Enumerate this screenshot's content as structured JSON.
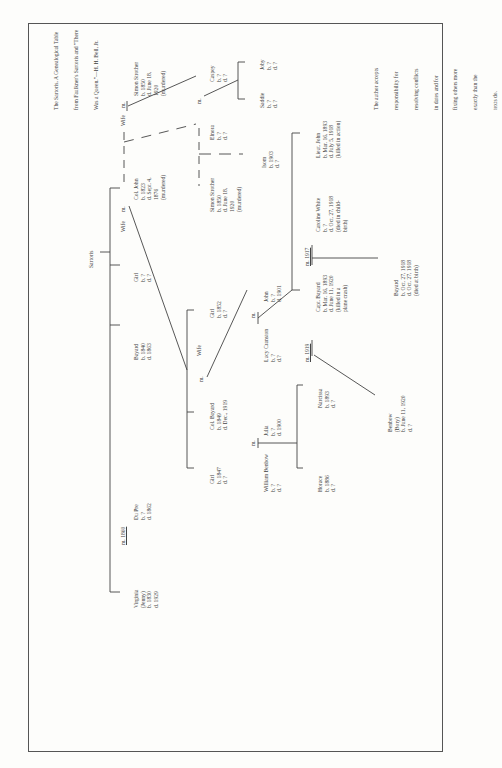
{
  "title": [
    "The Sartoris, A Genealogical Table",
    "from Faulkner's Sartoris and \"There",
    "Was a Queen.\"—H. H. Bell, Jr."
  ],
  "note": [
    "The author accepts",
    "responsibility for",
    "resolving conflicts",
    "in dates and for",
    "fixing others more",
    "exactly than the",
    "texts do."
  ],
  "root": "Sartoris",
  "people": {
    "virginia": [
      "Virginia",
      "(Jenny)",
      "b. 1830",
      "d. 1929"
    ],
    "m1860": "m. 1860",
    "dupre": [
      "Du Pre",
      "b. ?",
      "d. 1862"
    ],
    "bayard1840": [
      "Bayard",
      "b. 1840",
      "d. 1863"
    ],
    "girl1": [
      "Girl",
      "b. ?",
      "d. ?"
    ],
    "wife1": "Wife",
    "m_a": "m.",
    "coljohn": [
      "Col. John",
      "b. 1823",
      "d. Sept. 4,",
      "1876",
      "(murdered)"
    ],
    "wife2": "Wife",
    "m_b": "m.",
    "simon1": [
      "Simon Strother",
      "b. 1850",
      "d. June 18,",
      "1920",
      "(murdered)"
    ],
    "simon2": [
      "Simon Strother",
      "b. 1850",
      "d. June 18,",
      "1920",
      "(murdered)"
    ],
    "elnora": [
      "Elnora",
      "b. ?",
      "d. ?"
    ],
    "m_c": "m.",
    "caspey": [
      "Caspey",
      "b. ?",
      "d. ?"
    ],
    "isom": [
      "Isom",
      "b. 1903",
      "d. ?"
    ],
    "saddie": [
      "Saddie",
      "b. ?",
      "d. ?"
    ],
    "joby": [
      "Joby",
      "b. ?",
      "d. ?"
    ],
    "girl1847": [
      "Girl",
      "b. 1847",
      "d. ?"
    ],
    "colbayard": [
      "Col. Bayard",
      "b. 1849",
      "d. Dec., 1919"
    ],
    "m_d": "m.",
    "wife3": "Wife",
    "girl1852": [
      "Girl",
      "b. 1852",
      "d. ?"
    ],
    "lucy": [
      "Lucy Cranston",
      "b. ?",
      "d.?"
    ],
    "m_e": "m.",
    "john1901": [
      "John",
      "b. ?",
      "d. 1901"
    ],
    "capt": [
      "Capt. Bayard",
      "b. Mar. 16, 1893",
      "d. June 11, 1920",
      "(killed in a",
      "plane crash)"
    ],
    "m1917": "m. 1917",
    "caroline": [
      "Caroline White",
      "b. ?",
      "d. Oct. 27, 1918",
      "(died in child-",
      "birth)"
    ],
    "lieut": [
      "Lieut. John",
      "b. Mar. 16, 1893",
      "d. July 5, 1918",
      "(killed in action)"
    ],
    "bayard1918": [
      "Bayard",
      "b. Oct. 27, 1918",
      "d. Oct. 27, 1918",
      "(died at birth)"
    ],
    "william": [
      "William Benbow",
      "b. ?",
      "d. ?"
    ],
    "m_f": "m.",
    "julia": [
      "Julia",
      "b. ?",
      "d. 1900"
    ],
    "m1919": "m. 1919",
    "horace": [
      "Horace",
      "b. 1886",
      "d. ?"
    ],
    "narcissa": [
      "Narcissa",
      "b. 1893",
      "d. ?"
    ],
    "benbow": [
      "Benbow",
      "(Bory)",
      "b. June 11, 1920",
      "d. ?"
    ]
  }
}
